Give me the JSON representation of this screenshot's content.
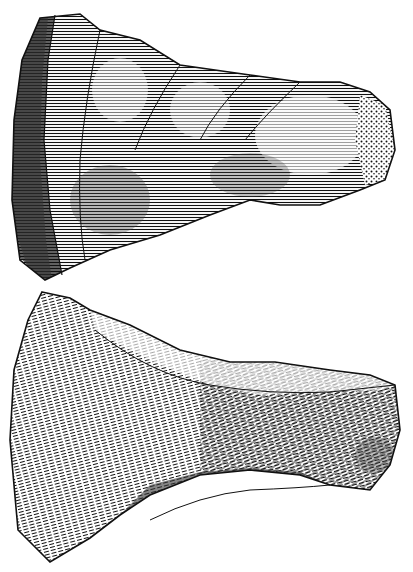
{
  "illustration": {
    "style": "wood-engraving line hatching, black ink on white",
    "background_color": "#ffffff",
    "ink_color": "#111111",
    "figures": [
      {
        "id": "top",
        "subject": "flaked flint axe, side view with cortex at narrow end",
        "bbox": [
          10,
          10,
          405,
          285
        ]
      },
      {
        "id": "bottom",
        "subject": "flaked flint axe, opposite face",
        "bbox": [
          8,
          292,
          400,
          565
        ]
      }
    ]
  }
}
